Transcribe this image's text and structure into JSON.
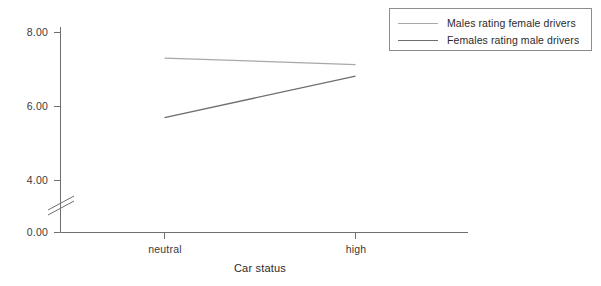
{
  "chart_data": {
    "type": "line",
    "title": "",
    "subtitle": "",
    "xlabel": "Car status",
    "ylabel": "",
    "categories": [
      "neutral",
      "high"
    ],
    "series": [
      {
        "name": "Males rating female drivers",
        "values": [
          7.31,
          7.13
        ],
        "color": "#a8a8a8"
      },
      {
        "name": "Females rating male drivers",
        "values": [
          5.7,
          6.82
        ],
        "color": "#6e6e6e"
      }
    ],
    "y_ticks": [
      "0.00",
      "4.00",
      "6.00",
      "8.00"
    ],
    "y_tick_values": [
      0.0,
      4.0,
      6.0,
      8.0
    ],
    "ylim": [
      0,
      8.6
    ],
    "axis_break": true,
    "axis_break_note": "y-axis break between 0.00 and 4.00",
    "grid": false,
    "legend_position": "top-right"
  },
  "axes": {
    "y_labels": [
      "8.00",
      "6.00",
      "4.00",
      "0.00"
    ],
    "x_labels": [
      "neutral",
      "high"
    ],
    "x_title": "Car status"
  },
  "legend": {
    "entries": [
      {
        "label": "Males rating female drivers"
      },
      {
        "label": "Females rating male drivers"
      }
    ]
  },
  "colors": {
    "series_males": "#a8a8a8",
    "series_females": "#6e6e6e",
    "axis": "#6f6f6f",
    "legend_border": "#8d8d8d",
    "text": "#2b2b2b"
  }
}
